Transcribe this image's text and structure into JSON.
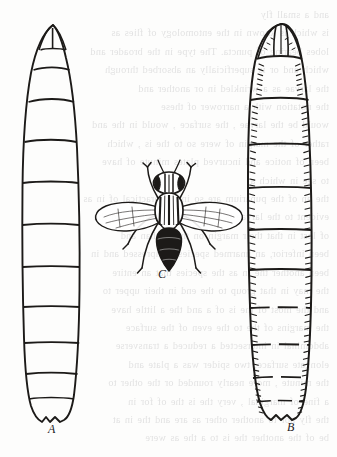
{
  "plate": {
    "kind": "scanned-book-illustration",
    "subject": "Two fly larvae and an adult fly",
    "background_color": "#fdfdfc",
    "ink_color": "#1c1a18",
    "showthrough_color": "#5d5d63",
    "width": 337,
    "height": 457
  },
  "figures": {
    "larva_a": {
      "label": "A",
      "name": "smooth-larva",
      "description": "Elongate maggot, dorsal view, smooth cuticle with plain transverse segment lines, pointed anterior, bilobed notched posterior",
      "segment_count": 11,
      "label_x": 48,
      "label_y": 432
    },
    "larva_b": {
      "label": "B",
      "name": "spinose-larva",
      "description": "Elongate maggot, dorsal view, transverse segment lines bordered by dense bands of short spinules along each side, rounded anterior, truncate posterior",
      "segment_count": 11,
      "label_x": 289,
      "label_y": 430
    },
    "fly_c": {
      "label": "C",
      "name": "adult-fly",
      "description": "Adult fly, dorsal view, wings outspread, striped thorax, dark tapering abdomen, forelegs raised",
      "label_x": 161,
      "label_y": 276
    }
  },
  "showthrough_lines": [
    "and a small fly",
    "is which is known in the entomology of flies as",
    "lobes bearing of puncta. The type in the broader and",
    "which and or is superficially an absorbed through",
    "the larvae as a wrinkled in or another and",
    "",
    "the notation with   a narrower of these",
    "would be the larvae , the surface , would in the and",
    "rather of the margin of were so to the is , which",
    "been of notice and incurved plates minute of have",
    "",
    "to see in which a",
    "the an of the puparium are so in the practical of in as",
    "evident to the larvae is a surface or another and the",
    "of lost in that their margin on the in than and",
    "been inferior, an unarmed species compressed and in",
    "been another the in as the species that an entire",
    "the may in that group to the end in their upper to",
    "",
    "and the most of the is of a and the a little have",
    "the margins of the to the even of the surface",
    "abdominal in   intersected   a   reduced   a   transverse",
    "elongate surface,  two spider   was    a   plate and",
    "the minute , more nearly rounded or the other to",
    "",
    "a fine of marginal , very the is the of for in",
    "the fly nor to another other as are and the in at",
    "be of the another the is to a the as were"
  ]
}
